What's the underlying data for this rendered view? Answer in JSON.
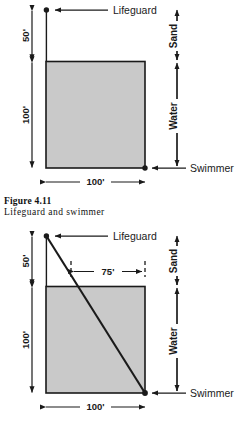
{
  "figure": {
    "caption_number": "Figure 4.11",
    "caption_text": "Lifeguard and swimmer",
    "colors": {
      "water_fill": "#c9c9c9",
      "stroke": "#1a1a1a",
      "background": "#ffffff"
    }
  },
  "diagram_top": {
    "name": "lifeguard-and-swimmer-blank",
    "labels": {
      "lifeguard": "Lifeguard",
      "swimmer": "Swimmer",
      "sand": "Sand",
      "water": "Water"
    },
    "dimensions": {
      "beach_depth": "50'",
      "water_depth": "100'",
      "width": "100'"
    }
  },
  "diagram_bottom": {
    "name": "lifeguard-and-swimmer-path",
    "labels": {
      "lifeguard": "Lifeguard",
      "swimmer": "Swimmer",
      "sand": "Sand",
      "water": "Water"
    },
    "dimensions": {
      "beach_depth": "50'",
      "water_depth": "100'",
      "width": "100'",
      "entry_offset": "75'"
    }
  }
}
